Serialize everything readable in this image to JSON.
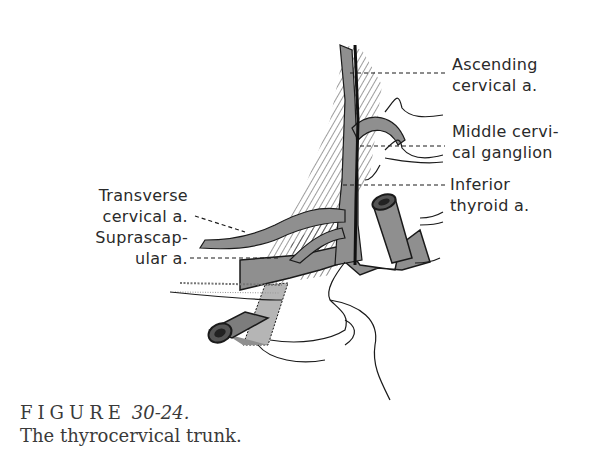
{
  "figure": {
    "number_label": "FIGURE",
    "number": "30-24.",
    "title": "The thyrocervical trunk."
  },
  "labels": {
    "ascending_cervical": [
      "Ascending",
      "cervical a."
    ],
    "middle_cervical_ganglion": [
      "Middle cervi-",
      "cal ganglion"
    ],
    "inferior_thyroid": [
      "Inferior",
      "thyroid a."
    ],
    "transverse_cervical": [
      "Transverse",
      "cervical a."
    ],
    "suprascapular": [
      "Suprascap-",
      "ular a."
    ]
  },
  "colors": {
    "ink": "#1a1a1a",
    "artery_fill": "#8f8f8f",
    "artery_light": "#b5b5b5",
    "background": "#ffffff"
  }
}
